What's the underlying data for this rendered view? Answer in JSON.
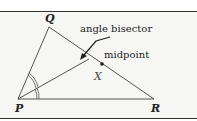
{
  "diagram": {
    "vertices": {
      "P": "P",
      "Q": "Q",
      "R": "R"
    },
    "labels": {
      "angle_bisector": "angle bisector",
      "midpoint": "midpoint",
      "point_x": "X"
    },
    "colors": {
      "line": "#555555",
      "background": "#f6f6f4",
      "border": "#333333"
    }
  }
}
